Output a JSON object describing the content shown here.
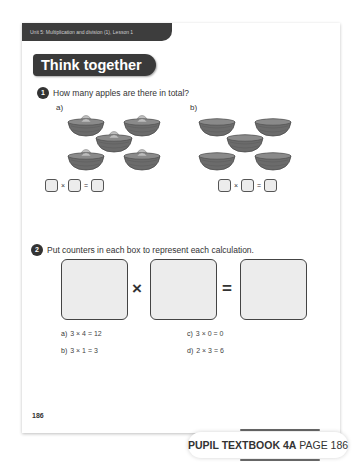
{
  "header": {
    "unit_label": "Unit 5: Multiplication and division (1), Lesson 1",
    "section_title": "Think together"
  },
  "question1": {
    "number": "1",
    "prompt": "How many apples are there in total?",
    "parts": [
      {
        "label": "a)",
        "bowls": 5,
        "apples_per_bowl": 1,
        "equation": {
          "op1": "×",
          "op2": "="
        }
      },
      {
        "label": "b)",
        "bowls": 5,
        "apples_per_bowl": 0,
        "equation": {
          "op1": "×",
          "op2": "="
        }
      }
    ]
  },
  "question2": {
    "number": "2",
    "prompt": "Put counters in each box to represent each calculation.",
    "operators": {
      "multiply": "×",
      "equals": "="
    },
    "calculations": [
      {
        "label": "a)",
        "text": "3 × 4 = 12"
      },
      {
        "label": "b)",
        "text": "3 × 1 = 3"
      },
      {
        "label": "c)",
        "text": "3 × 0 = 0"
      },
      {
        "label": "d)",
        "text": "2 × 3 = 6"
      }
    ]
  },
  "page_number": "186",
  "footer": {
    "book": "PUPIL TEXTBOOK 4A",
    "page": "PAGE 186"
  },
  "colors": {
    "header_dark": "#3d3d3d",
    "box_fill": "#ececec",
    "bowl": "#6b6b6b",
    "apple": "#bdbdbd"
  }
}
